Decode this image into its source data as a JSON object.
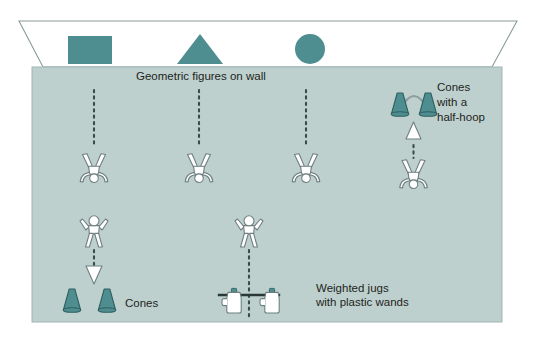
{
  "diagram": {
    "title_text": "Geometric figures on wall",
    "labels": {
      "wall_figures": "Geometric figures on wall",
      "cones_halfhoop_line1": "Cones",
      "cones_halfhoop_line2": "with a",
      "cones_halfhoop_line3": "half-hoop",
      "cones": "Cones",
      "jugs_line1": "Weighted jugs",
      "jugs_line2": "with plastic wands"
    },
    "colors": {
      "field_fill": "#bdd0ce",
      "field_stroke": "#9fb5b4",
      "wall_fill": "#ffffff",
      "wall_stroke": "#8a9b9a",
      "shape_fill": "#4f8e90",
      "cone_fill": "#4f8e90",
      "cone_stroke": "#2f5f60",
      "figure_fill": "#ffffff",
      "figure_stroke": "#6f7f80",
      "dotted_line": "#3d4a4a",
      "text": "#231f20",
      "jug_fill": "#ffffff",
      "jug_cap_fill": "#4f8e90",
      "wand_stroke": "#2b3838",
      "hoop_stroke": "#8d9c9c"
    },
    "wall_shapes": [
      {
        "name": "square-shape",
        "type": "rectangle"
      },
      {
        "name": "triangle-shape",
        "type": "triangle"
      },
      {
        "name": "circle-shape",
        "type": "circle"
      }
    ],
    "lanes": [
      {
        "name": "lane-1",
        "has_dotted_path": true,
        "has_down_arrow": true
      },
      {
        "name": "lane-2",
        "has_dotted_path": true,
        "has_down_arrow": false
      },
      {
        "name": "lane-3",
        "has_dotted_path": true,
        "has_down_arrow": false
      },
      {
        "name": "lane-4",
        "has_dotted_path": true,
        "has_up_arrow": true
      }
    ],
    "figures": {
      "overhead_count": 4,
      "frontal_count": 2
    },
    "equipment": {
      "cones_pair_count": 2,
      "halfhoop_cone_count": 2,
      "jug_count": 2,
      "wand_count": 1
    }
  }
}
